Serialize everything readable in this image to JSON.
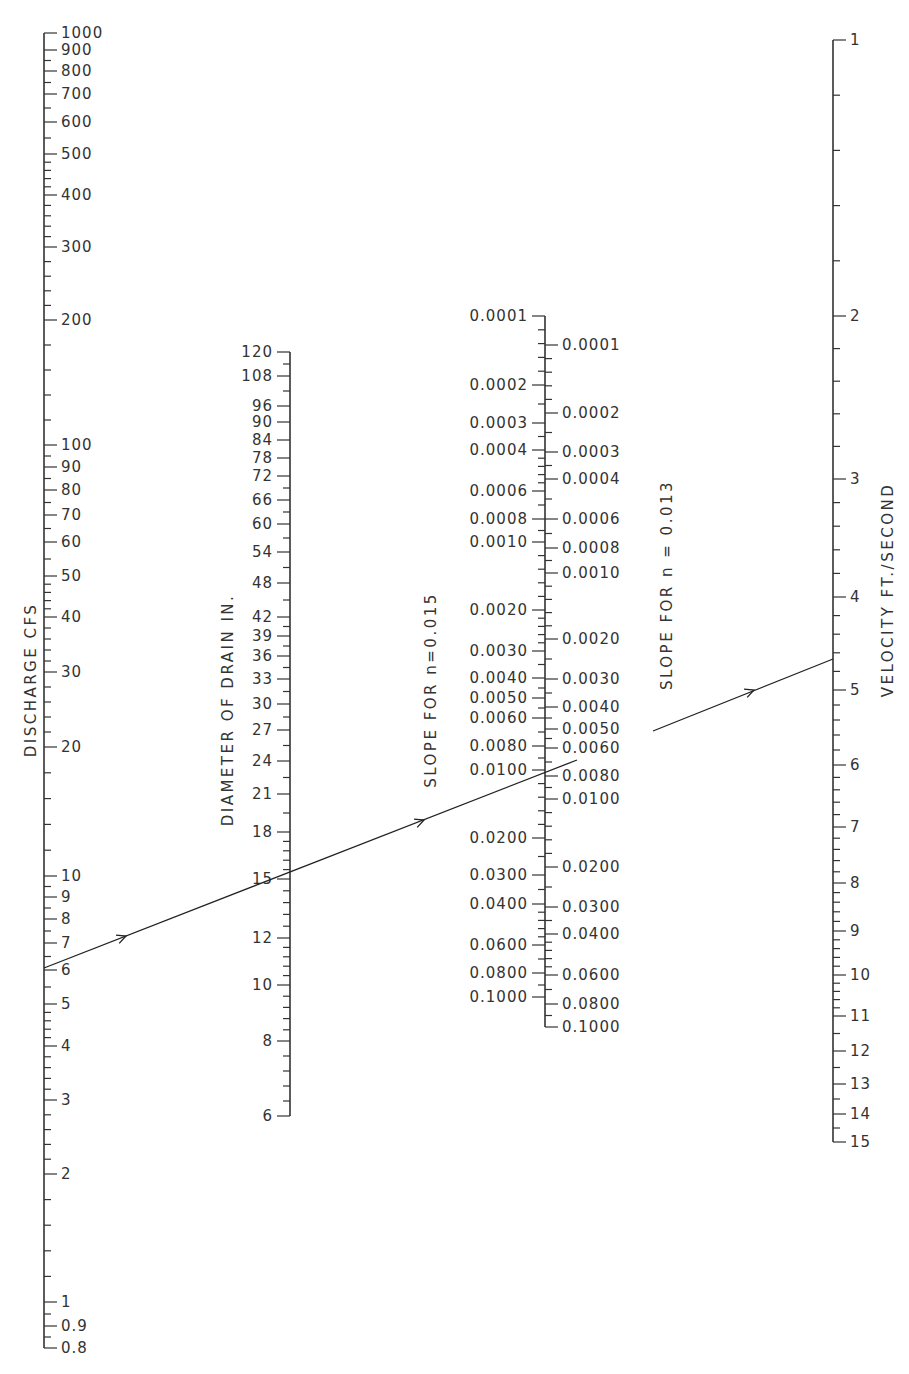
{
  "diagram": {
    "type": "nomograph",
    "line_color": "#333333",
    "background": "#ffffff"
  },
  "scales": [
    {
      "id": "discharge",
      "title": "DISCHARGE  CFS",
      "x": 44,
      "label_side": "right",
      "title_x": 36,
      "title_y": 680,
      "labels": [
        {
          "v": "1000",
          "y": 33
        },
        {
          "v": "900",
          "y": 50
        },
        {
          "v": "800",
          "y": 71
        },
        {
          "v": "700",
          "y": 94
        },
        {
          "v": "600",
          "y": 122
        },
        {
          "v": "500",
          "y": 154
        },
        {
          "v": "400",
          "y": 195
        },
        {
          "v": "300",
          "y": 247
        },
        {
          "v": "200",
          "y": 320
        },
        {
          "v": "100",
          "y": 445
        },
        {
          "v": "90",
          "y": 467
        },
        {
          "v": "80",
          "y": 490
        },
        {
          "v": "70",
          "y": 515
        },
        {
          "v": "60",
          "y": 542
        },
        {
          "v": "50",
          "y": 576
        },
        {
          "v": "40",
          "y": 617
        },
        {
          "v": "30",
          "y": 672
        },
        {
          "v": "20",
          "y": 747
        },
        {
          "v": "10",
          "y": 876
        },
        {
          "v": "9",
          "y": 897
        },
        {
          "v": "8",
          "y": 919
        },
        {
          "v": "7",
          "y": 943
        },
        {
          "v": "6",
          "y": 970
        },
        {
          "v": "5",
          "y": 1004
        },
        {
          "v": "4",
          "y": 1046
        },
        {
          "v": "3",
          "y": 1100
        },
        {
          "v": "2",
          "y": 1174
        },
        {
          "v": "1",
          "y": 1302
        },
        {
          "v": "0.9",
          "y": 1326
        },
        {
          "v": "0.8",
          "y": 1348
        }
      ],
      "top_y": 33,
      "bottom_y": 1348
    },
    {
      "id": "diameter",
      "title": "DIAMETER  OF  DRAIN  IN.",
      "x": 290,
      "label_side": "left",
      "title_x": 233,
      "title_y": 710,
      "labels": [
        {
          "v": "120",
          "y": 352
        },
        {
          "v": "108",
          "y": 376
        },
        {
          "v": "96",
          "y": 406
        },
        {
          "v": "90",
          "y": 422
        },
        {
          "v": "84",
          "y": 440
        },
        {
          "v": "78",
          "y": 458
        },
        {
          "v": "72",
          "y": 476
        },
        {
          "v": "66",
          "y": 500
        },
        {
          "v": "60",
          "y": 524
        },
        {
          "v": "54",
          "y": 552
        },
        {
          "v": "48",
          "y": 583
        },
        {
          "v": "42",
          "y": 617
        },
        {
          "v": "39",
          "y": 636
        },
        {
          "v": "36",
          "y": 656
        },
        {
          "v": "33",
          "y": 679
        },
        {
          "v": "30",
          "y": 704
        },
        {
          "v": "27",
          "y": 730
        },
        {
          "v": "24",
          "y": 761
        },
        {
          "v": "21",
          "y": 794
        },
        {
          "v": "18",
          "y": 832
        },
        {
          "v": "15",
          "y": 879
        },
        {
          "v": "12",
          "y": 938
        },
        {
          "v": "10",
          "y": 985
        },
        {
          "v": "8",
          "y": 1041
        },
        {
          "v": "6",
          "y": 1116
        }
      ],
      "top_y": 352,
      "bottom_y": 1116
    },
    {
      "id": "slope_n015",
      "title": "SLOPE  FOR  n=0.015",
      "x": 545,
      "label_side": "left",
      "title_x": 436,
      "title_y": 690,
      "labels": [
        {
          "v": "0.0001",
          "y": 316
        },
        {
          "v": "0.0002",
          "y": 385
        },
        {
          "v": "0.0003",
          "y": 423
        },
        {
          "v": "0.0004",
          "y": 450
        },
        {
          "v": "0.0006",
          "y": 491
        },
        {
          "v": "0.0008",
          "y": 519
        },
        {
          "v": "0.0010",
          "y": 542
        },
        {
          "v": "0.0020",
          "y": 610
        },
        {
          "v": "0.0030",
          "y": 651
        },
        {
          "v": "0.0040",
          "y": 678
        },
        {
          "v": "0.0050",
          "y": 698
        },
        {
          "v": "0.0060",
          "y": 718
        },
        {
          "v": "0.0080",
          "y": 746
        },
        {
          "v": "0.0100",
          "y": 770
        },
        {
          "v": "0.0200",
          "y": 838
        },
        {
          "v": "0.0300",
          "y": 875
        },
        {
          "v": "0.0400",
          "y": 904
        },
        {
          "v": "0.0600",
          "y": 945
        },
        {
          "v": "0.0800",
          "y": 973
        },
        {
          "v": "0.1000",
          "y": 997
        }
      ],
      "top_y": 316,
      "bottom_y": 997
    },
    {
      "id": "slope_n013",
      "title": "SLOPE  FOR  n = 0.013",
      "x": 545,
      "label_side": "right",
      "title_x": 672,
      "title_y": 585,
      "labels": [
        {
          "v": "0.0001",
          "y": 345
        },
        {
          "v": "0.0002",
          "y": 413
        },
        {
          "v": "0.0003",
          "y": 452
        },
        {
          "v": "0.0004",
          "y": 479
        },
        {
          "v": "0.0006",
          "y": 519
        },
        {
          "v": "0.0008",
          "y": 548
        },
        {
          "v": "0.0010",
          "y": 573
        },
        {
          "v": "0.0020",
          "y": 639
        },
        {
          "v": "0.0030",
          "y": 679
        },
        {
          "v": "0.0040",
          "y": 707
        },
        {
          "v": "0.0050",
          "y": 729
        },
        {
          "v": "0.0060",
          "y": 748
        },
        {
          "v": "0.0080",
          "y": 776
        },
        {
          "v": "0.0100",
          "y": 799
        },
        {
          "v": "0.0200",
          "y": 867
        },
        {
          "v": "0.0300",
          "y": 907
        },
        {
          "v": "0.0400",
          "y": 934
        },
        {
          "v": "0.0600",
          "y": 975
        },
        {
          "v": "0.0800",
          "y": 1004
        },
        {
          "v": "0.1000",
          "y": 1027
        }
      ],
      "top_y": 316,
      "bottom_y": 1027
    },
    {
      "id": "velocity",
      "title": "VELOCITY  FT./SECOND",
      "x": 833,
      "label_side": "right",
      "title_x": 893,
      "title_y": 590,
      "labels": [
        {
          "v": "1",
          "y": 40
        },
        {
          "v": "2",
          "y": 316
        },
        {
          "v": "3",
          "y": 479
        },
        {
          "v": "4",
          "y": 597
        },
        {
          "v": "5",
          "y": 690
        },
        {
          "v": "6",
          "y": 765
        },
        {
          "v": "7",
          "y": 827
        },
        {
          "v": "8",
          "y": 883
        },
        {
          "v": "9",
          "y": 931
        },
        {
          "v": "10",
          "y": 975
        },
        {
          "v": "11",
          "y": 1016
        },
        {
          "v": "12",
          "y": 1051
        },
        {
          "v": "13",
          "y": 1084
        },
        {
          "v": "14",
          "y": 1114
        },
        {
          "v": "15",
          "y": 1142
        }
      ],
      "top_y": 40,
      "bottom_y": 1142
    }
  ],
  "solution_line": {
    "description": "Example: discharge 6.2 cfs, 15 in. drain, slope ~0.0090 (n=0.015) / ~0.0053 (n=0.013), velocity ~4.6 ft/s",
    "points": [
      {
        "scale": "discharge",
        "value": "6.2",
        "x": 44,
        "y": 968
      },
      {
        "scale": "diameter",
        "value": "15",
        "x": 290,
        "y": 877
      },
      {
        "scale": "slope",
        "value": "0.0090",
        "x": 545,
        "y": 768
      },
      {
        "scale": "velocity",
        "value": "4.6",
        "x": 833,
        "y": 659
      }
    ],
    "segments": [
      {
        "x1": 44,
        "y1": 968,
        "x2": 577,
        "y2": 760
      },
      {
        "x1": 653,
        "y1": 731,
        "x2": 833,
        "y2": 659
      }
    ],
    "arrows": [
      {
        "x": 126,
        "y": 936
      },
      {
        "x": 424,
        "y": 820
      },
      {
        "x": 754,
        "y": 690
      }
    ]
  }
}
